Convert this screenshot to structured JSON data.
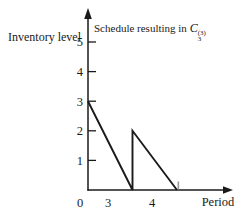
{
  "figure": {
    "title_prefix": "Schedule resulting in ",
    "title_symbol": "C",
    "title_sub": "3",
    "title_sup": "(3)"
  },
  "chart_data": {
    "type": "line",
    "xlabel": "Period",
    "ylabel": "Inventory level",
    "y_ticks": [
      1,
      2,
      3,
      4,
      5
    ],
    "ylim": [
      0,
      5.9
    ],
    "x_origin_label": "0",
    "x_labels": [
      {
        "label": "3",
        "pos": 0.45
      },
      {
        "label": "4",
        "pos": 1.44
      }
    ],
    "series": [
      {
        "name": "inventory-level",
        "points": [
          [
            0,
            3
          ],
          [
            1,
            0
          ],
          [
            1,
            2
          ],
          [
            2,
            0
          ]
        ]
      }
    ],
    "end_tick_pos": 2.03,
    "legend": "none",
    "grid": false,
    "axis_color": "#1a1a1a",
    "line_color": "#1a1a1a",
    "end_tick_color": "#999999",
    "background": "#ffffff"
  }
}
